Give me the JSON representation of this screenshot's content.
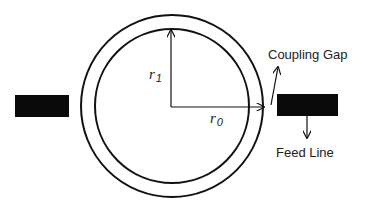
{
  "diagram": {
    "labels": {
      "inner_radius": {
        "symbol": "r",
        "subscript": "1"
      },
      "outer_radius": {
        "symbol": "r",
        "subscript": "0"
      },
      "coupling_gap": "Coupling Gap",
      "feed_line": "Feed Line"
    },
    "colors": {
      "stroke": "#111111",
      "fill": "#0a0a0a",
      "background": "#ffffff"
    }
  }
}
